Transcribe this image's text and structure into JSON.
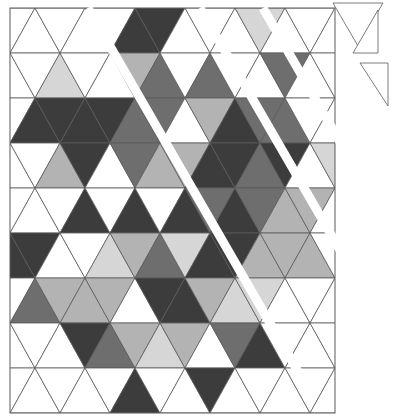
{
  "figure": {
    "rows": 9,
    "grid": {
      "left": 10,
      "top": 8,
      "row_height": 45,
      "half_width": 25,
      "columns": 14
    },
    "colors": {
      "W": "#ffffff",
      "L": "#d6d6d6",
      "G": "#b3b3b3",
      "M": "#6e6e6e",
      "D": "#3c3c3c",
      "line": "#5a5a5a"
    },
    "cells": [
      "WWWWWDDWWWLWWW",
      "WWLWWGMWMWWMWW",
      "WDDDDMMWGDMMWW",
      "WWGDWMGGDDMDWL",
      "WWWDWDWDMDMGGW",
      "DDWWLGMLDDGGGW",
      "WMGGGWDDGLLWWW",
      "WWWDMGLGWMDWWW",
      "WWWWWDWWDWWWWW"
    ],
    "gaps": [
      {
        "x1": 88,
        "y1": 8,
        "x2": 300,
        "y2": 375
      },
      {
        "x1": 200,
        "y1": 8,
        "x2": 355,
        "y2": 276
      },
      {
        "x1": 263,
        "y1": 8,
        "x2": 355,
        "y2": 168
      }
    ],
    "loose_pieces": [
      {
        "points": "333,3 383,3 358,46"
      },
      {
        "points": "378,10 378,53 353,53"
      },
      {
        "points": "360,63 388,63 388,106"
      }
    ]
  }
}
